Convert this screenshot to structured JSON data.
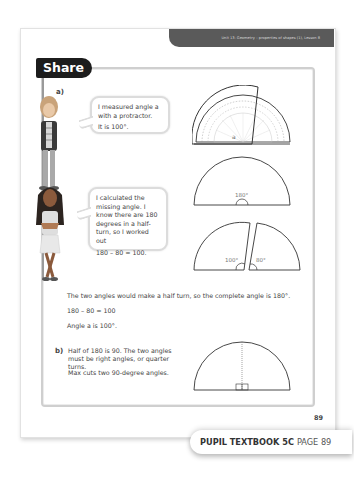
{
  "header": {
    "unit_title": "Unit 13: Geometry – properties of shapes (1), Lesson 8"
  },
  "section": {
    "title": "Share"
  },
  "part_a": {
    "label": "a)",
    "bubble1": {
      "line1": "I measured angle a with a protractor.",
      "line2": "It is 100°."
    },
    "bubble2": {
      "line1": "I calculated the missing angle. I know there are 180 degrees in a half-turn, so I worked out",
      "line2": "180 – 80 = 100."
    },
    "diagram_protractor": {
      "angle_label": "a"
    },
    "diagram_semicircle": {
      "angle_label": "180°"
    },
    "diagram_split": {
      "left_angle": "100°",
      "right_angle": "80°"
    },
    "explanation": [
      "The two angles would make a half turn, so the complete angle is 180°.",
      "180 – 80 = 100",
      "Angle a is 100°."
    ]
  },
  "part_b": {
    "label": "b)",
    "text1": "Half of 180 is 90. The two angles must be right angles, or quarter turns.",
    "text2": "Max cuts two 90-degree angles."
  },
  "page_number": "89",
  "footer": {
    "book": "PUPIL TEXTBOOK 5C",
    "page": "PAGE 89"
  },
  "colors": {
    "header_bar": "#5a5a5a",
    "share_tab": "#1c1c1c",
    "frame_border": "#cfcfcf"
  }
}
